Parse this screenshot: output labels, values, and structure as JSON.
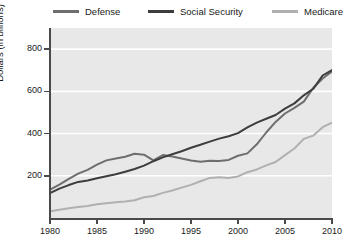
{
  "legend": {
    "position": "top",
    "items": [
      {
        "name": "Defense",
        "color": "#6e6e6e"
      },
      {
        "name": "Social Security",
        "color": "#3d3d3d"
      },
      {
        "name": "Medicare",
        "color": "#b0b0b0"
      }
    ]
  },
  "axes": {
    "y_title": "Dollars (in billions)",
    "y_ticks": [
      200,
      400,
      600,
      800
    ],
    "y_tick_labels": [
      "200",
      "400",
      "600",
      "800"
    ],
    "y_min": 0,
    "y_max": 900,
    "x_ticks": [
      1980,
      1985,
      1990,
      1995,
      2000,
      2005,
      2010
    ],
    "x_tick_labels": [
      "1980",
      "1985",
      "1990",
      "1995",
      "2000",
      "2005",
      "2010"
    ],
    "x_min": 1980,
    "x_max": 2010,
    "grid": "horizontal-white"
  },
  "style": {
    "plot_background": "#e8e8e8",
    "gridline_color": "#ffffff",
    "axis_color": "#4a4a4a",
    "text_color": "#1a1a1a",
    "page_background": "#ffffff"
  },
  "chart_data": {
    "type": "line",
    "title": "",
    "subtitle": "",
    "xlabel": "",
    "ylabel": "Dollars (in billions)",
    "xlim": [
      1980,
      2010
    ],
    "ylim": [
      0,
      900
    ],
    "grid": true,
    "legend_position": "top",
    "x": [
      1980,
      1981,
      1982,
      1983,
      1984,
      1985,
      1986,
      1987,
      1988,
      1989,
      1990,
      1991,
      1992,
      1993,
      1994,
      1995,
      1996,
      1997,
      1998,
      1999,
      2000,
      2001,
      2002,
      2003,
      2004,
      2005,
      2006,
      2007,
      2008,
      2009,
      2010
    ],
    "series": [
      {
        "name": "Defense",
        "color": "#6e6e6e",
        "values": [
          134,
          158,
          185,
          210,
          228,
          253,
          273,
          282,
          290,
          304,
          300,
          273,
          298,
          291,
          282,
          272,
          266,
          271,
          270,
          275,
          295,
          306,
          349,
          405,
          455,
          495,
          522,
          551,
          616,
          661,
          694
        ]
      },
      {
        "name": "Social Security",
        "color": "#3d3d3d",
        "values": [
          118,
          139,
          156,
          171,
          178,
          188,
          198,
          207,
          219,
          232,
          248,
          269,
          287,
          302,
          316,
          333,
          347,
          362,
          376,
          387,
          402,
          429,
          452,
          470,
          488,
          518,
          543,
          581,
          612,
          675,
          701
        ]
      },
      {
        "name": "Medicare",
        "color": "#b0b0b0",
        "values": [
          32,
          39,
          46,
          52,
          57,
          65,
          70,
          75,
          78,
          84,
          98,
          104,
          119,
          130,
          144,
          157,
          174,
          190,
          193,
          190,
          197,
          217,
          230,
          249,
          265,
          298,
          329,
          375,
          390,
          430,
          452
        ]
      }
    ]
  }
}
